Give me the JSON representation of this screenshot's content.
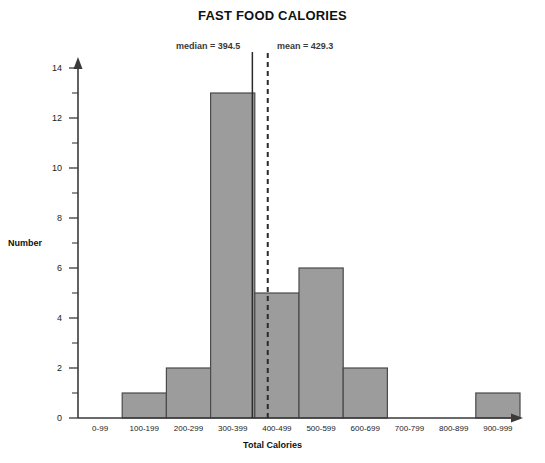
{
  "chart_data": {
    "type": "bar",
    "title": "FAST FOOD CALORIES",
    "xlabel": "Total Calories",
    "ylabel": "Number",
    "categories": [
      "0-99",
      "100-199",
      "200-299",
      "300-399",
      "400-499",
      "500-599",
      "600-699",
      "700-799",
      "800-899",
      "900-999"
    ],
    "values": [
      0,
      1,
      2,
      13,
      5,
      6,
      2,
      0,
      0,
      1
    ],
    "ylim": [
      0,
      14
    ],
    "ytick_labels": [
      "0",
      "2",
      "4",
      "6",
      "8",
      "10",
      "12",
      "14"
    ],
    "ytick_values": [
      0,
      2,
      4,
      6,
      8,
      10,
      12,
      14
    ],
    "yminor_values": [
      1,
      3,
      5,
      7,
      9,
      11,
      13
    ],
    "grid": false,
    "legend": "none",
    "bar_color": "#9c9c9c",
    "bar_border_color": "#4a4a4a",
    "axis_color": "#3a3a3a",
    "annotations": [
      {
        "name": "median",
        "label": "median = 394.5",
        "value": 394.5,
        "line_style": "solid",
        "color": "#2b2b2b"
      },
      {
        "name": "mean",
        "label": "mean = 429.3",
        "value": 429.3,
        "line_style": "dashed",
        "color": "#2b2b2b"
      }
    ]
  }
}
